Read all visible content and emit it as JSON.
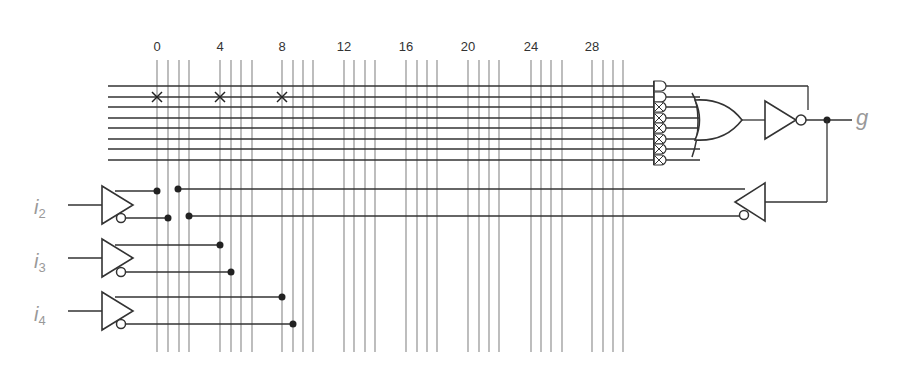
{
  "diagram": {
    "type": "PAL macrocell logic diagram",
    "column_labels": [
      {
        "text": "0",
        "x": 157
      },
      {
        "text": "4",
        "x": 220
      },
      {
        "text": "8",
        "x": 282
      },
      {
        "text": "12",
        "x": 344
      },
      {
        "text": "16",
        "x": 406
      },
      {
        "text": "20",
        "x": 468
      },
      {
        "text": "24",
        "x": 531
      },
      {
        "text": "28",
        "x": 592
      }
    ],
    "column_x": [
      157,
      168,
      179,
      189,
      220,
      231,
      241,
      252,
      282,
      293,
      303,
      313,
      344,
      354,
      365,
      375,
      406,
      417,
      427,
      437,
      468,
      479,
      489,
      499,
      531,
      541,
      551,
      562,
      592,
      603,
      613,
      623
    ],
    "product_rows_y": [
      86,
      97,
      107,
      118,
      128,
      139,
      149,
      160
    ],
    "fuse_crosses": [
      {
        "col": 0,
        "row": 1
      },
      {
        "col": 4,
        "row": 1
      },
      {
        "col": 8,
        "row": 1
      }
    ],
    "inputs": [
      {
        "name": "i",
        "sub": "2",
        "label_y": 196
      },
      {
        "name": "i",
        "sub": "3",
        "label_y": 250
      },
      {
        "name": "i",
        "sub": "4",
        "label_y": 303
      }
    ],
    "output": {
      "name": "g"
    },
    "colors": {
      "line": "#333333",
      "grid": "#888888",
      "label": "#999999"
    }
  }
}
